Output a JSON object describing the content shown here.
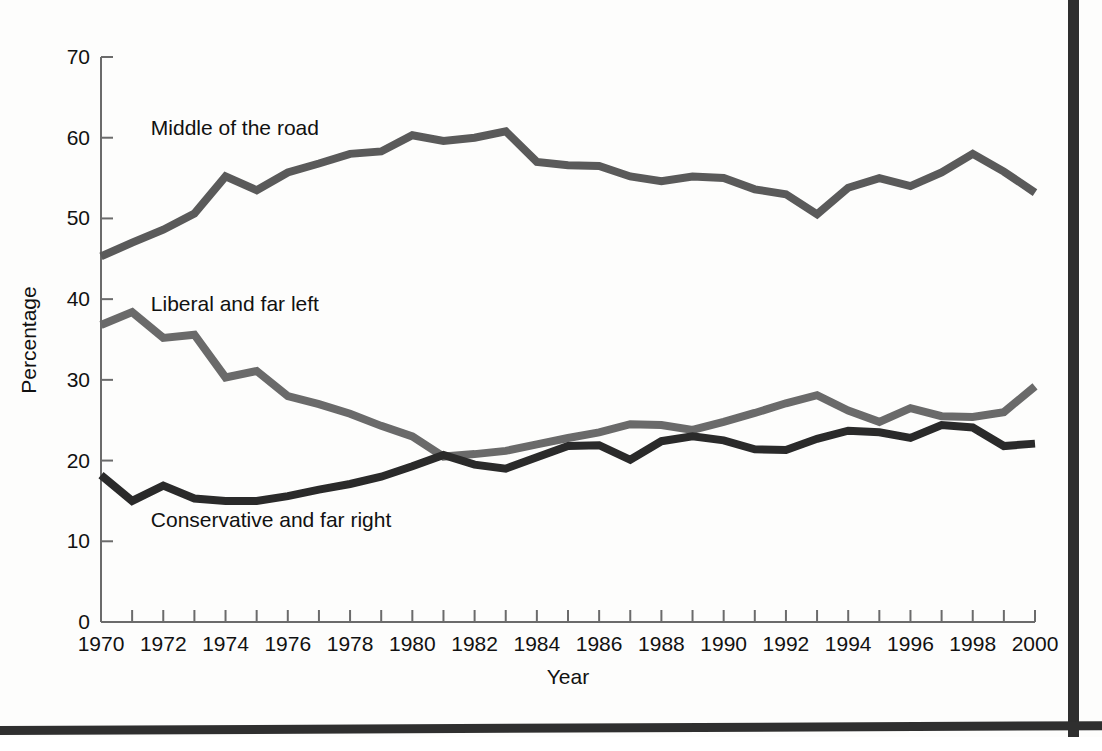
{
  "chart_data": {
    "type": "line",
    "title": "",
    "xlabel": "Year",
    "ylabel": "Percentage",
    "xlim": [
      1970,
      2000
    ],
    "ylim": [
      0,
      70
    ],
    "grid": false,
    "legend_position": "inline-annotations",
    "x": [
      1970,
      1971,
      1972,
      1973,
      1974,
      1975,
      1976,
      1977,
      1978,
      1979,
      1980,
      1981,
      1982,
      1983,
      1984,
      1985,
      1986,
      1987,
      1988,
      1989,
      1990,
      1991,
      1992,
      1993,
      1994,
      1995,
      1996,
      1997,
      1998,
      1999,
      2000
    ],
    "xticks": [
      1970,
      1972,
      1974,
      1976,
      1978,
      1980,
      1982,
      1984,
      1986,
      1988,
      1990,
      1992,
      1994,
      1996,
      1998,
      2000
    ],
    "xticklabels": [
      "1970",
      "1972",
      "1974",
      "1976",
      "1978",
      "1980",
      "1982",
      "1984",
      "1986",
      "1988",
      "1990",
      "1992",
      "1994",
      "1996",
      "1998",
      "2000"
    ],
    "yticks": [
      0,
      10,
      20,
      30,
      40,
      50,
      60,
      70
    ],
    "yticklabels": [
      "0",
      "10",
      "20",
      "30",
      "40",
      "50",
      "60",
      "70"
    ],
    "series": [
      {
        "name": "Middle of the road",
        "color": "#5a5a5a",
        "values": [
          45.3,
          47.0,
          48.6,
          50.6,
          55.2,
          53.5,
          55.7,
          56.8,
          58.0,
          58.3,
          60.3,
          59.6,
          60.0,
          60.8,
          57.0,
          56.6,
          56.5,
          55.2,
          54.6,
          55.2,
          55.0,
          53.6,
          53.0,
          50.5,
          53.8,
          55.0,
          54.0,
          55.7,
          58.0,
          55.8,
          53.2
        ]
      },
      {
        "name": "Liberal and far left",
        "color": "#6a6a6a",
        "values": [
          36.8,
          38.4,
          35.2,
          35.6,
          30.3,
          31.1,
          28.0,
          27.0,
          25.8,
          24.3,
          23.0,
          20.5,
          20.8,
          21.2,
          22.0,
          22.8,
          23.5,
          24.5,
          24.4,
          23.8,
          24.8,
          25.9,
          27.1,
          28.1,
          26.2,
          24.8,
          26.5,
          25.5,
          25.4,
          26.0,
          29.2
        ]
      },
      {
        "name": "Conservative and far right",
        "color": "#2a2a2a",
        "values": [
          18.2,
          15.0,
          16.9,
          15.3,
          15.0,
          15.0,
          15.6,
          16.4,
          17.1,
          18.0,
          19.3,
          20.7,
          19.5,
          19.0,
          20.4,
          21.8,
          21.9,
          20.1,
          22.4,
          23.0,
          22.5,
          21.4,
          21.3,
          22.7,
          23.7,
          23.5,
          22.8,
          24.4,
          24.1,
          21.8,
          22.1
        ]
      }
    ],
    "annotations": [
      {
        "text": "Middle of the road",
        "x": 1971.6,
        "y": 61.2
      },
      {
        "text": "Liberal and far left",
        "x": 1971.6,
        "y": 39.4
      },
      {
        "text": "Conservative and far right",
        "x": 1971.6,
        "y": 12.6
      }
    ]
  }
}
